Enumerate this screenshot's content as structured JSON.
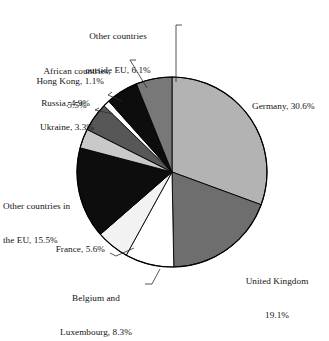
{
  "chart_data": {
    "type": "pie",
    "title": "",
    "xlabel": "",
    "ylabel": "",
    "units": "percent",
    "legend_position": "none",
    "grid": false,
    "start_angle_deg": 0,
    "direction": "clockwise",
    "categories": [
      "Germany",
      "United Kingdom",
      "Belgium and Luxembourg",
      "France",
      "Other countries in the EU",
      "Ukraine",
      "Russia",
      "Hong Kong",
      "African countries",
      "Other countries outside EU"
    ],
    "values": [
      30.6,
      19.1,
      8.3,
      5.6,
      15.5,
      3.3,
      4.9,
      1.1,
      5.5,
      6.1
    ],
    "total": 100.0,
    "slices": [
      {
        "name": "Germany",
        "value": 30.6,
        "label": "Germany, 30.6%",
        "color": "#b3b3b3"
      },
      {
        "name": "United Kingdom",
        "value": 19.1,
        "label_line1": "United Kingdom",
        "label_line2": "19.1%",
        "color": "#6e6e6e"
      },
      {
        "name": "Belgium and Luxembourg",
        "value": 8.3,
        "label_line1": "Belgium and",
        "label_line2": "Luxembourg, 8.3%",
        "color": "#ffffff"
      },
      {
        "name": "France",
        "value": 5.6,
        "label": "France, 5.6%",
        "color": "#f2f2f2"
      },
      {
        "name": "Other countries in the EU",
        "value": 15.5,
        "label_line1": "Other countries in",
        "label_line2": "the EU, 15.5%",
        "color": "#0d0d0d"
      },
      {
        "name": "Ukraine",
        "value": 3.3,
        "label": "Ukraine, 3.3%",
        "color": "#c9c9c9"
      },
      {
        "name": "Russia",
        "value": 4.9,
        "label": "Russia, 4.9%",
        "color": "#575757"
      },
      {
        "name": "Hong Kong",
        "value": 1.1,
        "label": "Hong Kong, 1.1%",
        "color": "#ffffff"
      },
      {
        "name": "African countries",
        "value": 5.5,
        "label_line1": "African countries,",
        "label_line2": "5.5%",
        "color": "#0d0d0d"
      },
      {
        "name": "Other countries outside EU",
        "value": 6.1,
        "label_line1": "Other countries",
        "label_line2": "outside EU, 6.1%",
        "color": "#787878"
      }
    ]
  },
  "labels": {
    "germany": "Germany, 30.6%",
    "uk_line1": "United Kingdom",
    "uk_line2": "19.1%",
    "belgium_line1": "Belgium and",
    "belgium_line2": "Luxembourg, 8.3%",
    "france": "France, 5.6%",
    "other_eu_line1": "Other countries in",
    "other_eu_line2": "the EU, 15.5%",
    "ukraine": "Ukraine, 3.3%",
    "russia": "Russia, 4.9%",
    "hongkong": "Hong Kong, 1.1%",
    "african_line1": "African countries,",
    "african_line2": "5.5%",
    "outside_eu_line1": "Other countries",
    "outside_eu_line2": "outside EU, 6.1%"
  },
  "style": {
    "background": "#ffffff",
    "outline": "#000000",
    "text": "#141414"
  }
}
